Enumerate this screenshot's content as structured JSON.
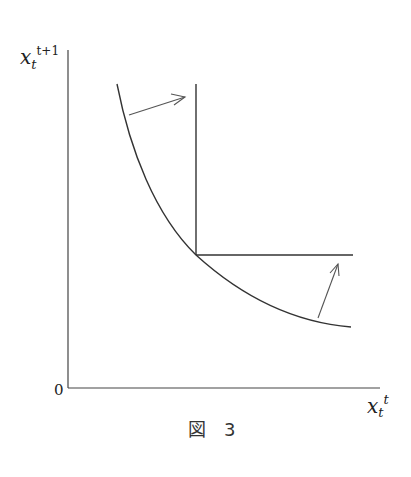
{
  "figure": {
    "caption": "図　3",
    "y_axis_label": {
      "base": "x",
      "sub": "t",
      "sup": "t+1"
    },
    "x_axis_label": {
      "base": "x",
      "sub": "t",
      "sup": "t"
    },
    "origin_label": "0"
  },
  "colors": {
    "line": "#333333",
    "arrow": "#555555",
    "text": "#222222"
  }
}
